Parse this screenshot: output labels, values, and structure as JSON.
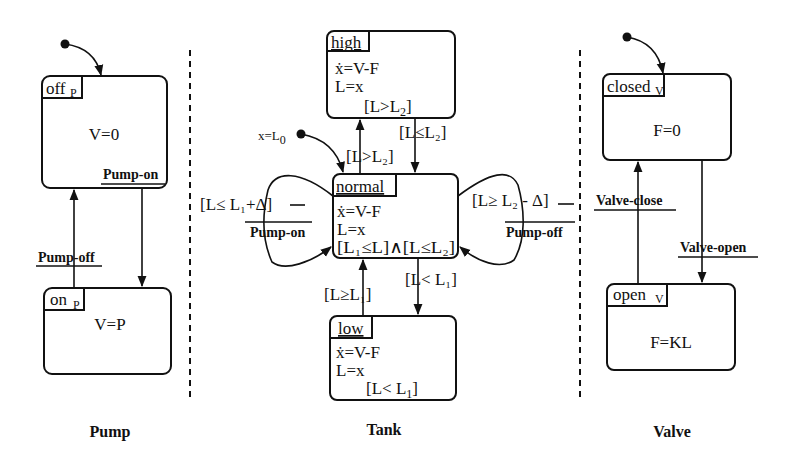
{
  "captions": {
    "pump": "Pump",
    "tank": "Tank",
    "valve": "Valve"
  },
  "pump": {
    "off": {
      "name": "off",
      "sub": "P",
      "body": "V=0"
    },
    "on": {
      "name": "on",
      "sub": "P",
      "body": "V=P"
    },
    "events": {
      "on": "Pump-on",
      "off": "Pump-off"
    }
  },
  "tank": {
    "initial": {
      "lhs": "x=L",
      "sub": "0"
    },
    "high": {
      "name": "high",
      "line1": "ẋ=V-F",
      "line2": "L=x",
      "inv_a": "[L>L",
      "inv_sub": "2",
      "inv_b": "]"
    },
    "normal": {
      "name": "normal",
      "line1": "ẋ=V-F",
      "line2": "L=x",
      "inv": "[L₁≤L]∧[L≤L₂]"
    },
    "low": {
      "name": "low",
      "line1": "ẋ=V-F",
      "line2": "L=x",
      "inv_a": "[L< L",
      "inv_sub": "1",
      "inv_b": "]"
    },
    "guards": {
      "to_high": "[L>L₂]",
      "from_high": "[L≤L₂]",
      "to_low": "[L< L₁]",
      "from_low": "[L≥L₁]",
      "left_loop": "[L≤ L₁+Δ]",
      "right_loop": "[L≥ L₂ - Δ]"
    },
    "loop_events": {
      "left": "Pump-on",
      "right": "Pump-off"
    }
  },
  "valve": {
    "closed": {
      "name": "closed",
      "sub": "V",
      "body": "F=0"
    },
    "open": {
      "name": "open",
      "sub": "V",
      "body": "F=KL"
    },
    "events": {
      "close": "Valve-close",
      "open": "Valve-open"
    }
  }
}
